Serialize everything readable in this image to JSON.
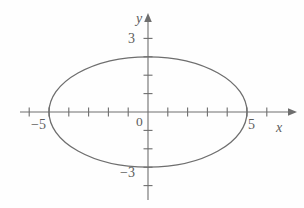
{
  "figure": {
    "background_color": "#fefefe",
    "ink_color": "#6e6e6e",
    "label_color": "#5d5d5d"
  },
  "labels": {
    "y_axis": "y",
    "x_axis": "x",
    "origin": "0",
    "y_pos_3": "3",
    "y_neg_3": "−3",
    "x_pos_5": "5",
    "x_neg_5": "−5"
  },
  "chart_data": {
    "type": "line",
    "xlabel": "x",
    "ylabel": "y",
    "grid": false,
    "legend": null,
    "xlim": [
      -6.5,
      7.2
    ],
    "ylim": [
      -5.4,
      5.2
    ],
    "x_ticks": [
      -6,
      -5,
      -4,
      -3,
      -2,
      -1,
      1,
      2,
      3,
      4,
      5,
      6
    ],
    "y_ticks": [
      -4,
      -3,
      -2,
      -1,
      1,
      2,
      3,
      4
    ],
    "x_tick_labels": [
      {
        "value": -5,
        "text": "−5"
      },
      {
        "value": 5,
        "text": "5"
      }
    ],
    "y_tick_labels": [
      {
        "value": 3,
        "text": "3"
      },
      {
        "value": -3,
        "text": "−3"
      }
    ],
    "origin_label": "0",
    "series": [
      {
        "name": "ellipse",
        "shape": "ellipse",
        "center": [
          0,
          0
        ],
        "semi_axis_x": 5,
        "semi_axis_y": 3,
        "equation": "x^2/25 + y^2/9 = 1",
        "x_intercepts": [
          -5,
          5
        ],
        "y_intercepts": [
          -3,
          3
        ],
        "stroke": "#6e6e6e",
        "fill": "none"
      }
    ],
    "annotations": []
  },
  "geometry": {
    "origin_px": {
      "x": 148,
      "y": 112
    },
    "unit_px": {
      "x": 19.8,
      "y": 18.4
    },
    "ellipse_px": {
      "cx": 148,
      "cy": 112,
      "rx": 99,
      "ry": 55
    }
  }
}
